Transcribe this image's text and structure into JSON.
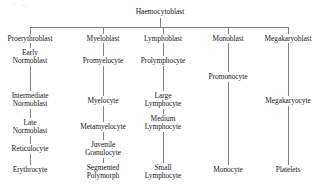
{
  "figure": {
    "root": {
      "label": "Haemocytoblast",
      "x": 160,
      "y": 8
    },
    "bus": {
      "y": 27,
      "x_start": 30,
      "x_end": 288,
      "stem_from_y": 18
    },
    "background_color": "#ffffff",
    "line_color": "#6d6d72",
    "text_color": "#17171a"
  },
  "columns": [
    {
      "name": "erythroid",
      "x": 30,
      "nodes": [
        {
          "label": "Proerythroblast",
          "y": 35
        },
        {
          "label": "Early\nNormoblast",
          "y": 49
        },
        {
          "label": "Intermediate\nNormoblast",
          "y": 92
        },
        {
          "label": "Late\nNormoblast",
          "y": 119
        },
        {
          "label": "Reticulocyte",
          "y": 145
        },
        {
          "label": "Erythrocyte",
          "y": 166
        }
      ]
    },
    {
      "name": "granulocytic",
      "x": 103,
      "nodes": [
        {
          "label": "Myeloblast",
          "y": 35
        },
        {
          "label": "Promyelocyte",
          "y": 57
        },
        {
          "label": "Myelocyte",
          "y": 97
        },
        {
          "label": "Metamyelocyte",
          "y": 123
        },
        {
          "label": "Juvenile\nGranulocyte",
          "y": 141
        },
        {
          "label": "Segmented\nPolymorph",
          "y": 164
        }
      ]
    },
    {
      "name": "lymphoid",
      "x": 163,
      "nodes": [
        {
          "label": "Lymphoblast",
          "y": 35
        },
        {
          "label": "Prolymphocyte",
          "y": 57
        },
        {
          "label": "Large\nLymphocyte",
          "y": 92
        },
        {
          "label": "Medium\nLymphocyte",
          "y": 115
        },
        {
          "label": "Small\nLymphocyte",
          "y": 164
        }
      ]
    },
    {
      "name": "monocytic",
      "x": 228,
      "nodes": [
        {
          "label": "Monoblast",
          "y": 35
        },
        {
          "label": "Promonocyte",
          "y": 73
        },
        {
          "label": "Monocyte",
          "y": 166
        }
      ]
    },
    {
      "name": "megakaryocytic",
      "x": 288,
      "nodes": [
        {
          "label": "Megakaryoblast",
          "y": 35
        },
        {
          "label": "Megakaryocyte",
          "y": 97
        },
        {
          "label": "Platelets",
          "y": 166
        }
      ]
    }
  ],
  "connectors": [
    {
      "from": "root",
      "to": "bus",
      "x": 160,
      "y1": 18,
      "y2": 27
    },
    {
      "from": "bus",
      "to": "Proerythroblast",
      "x": 30,
      "y1": 27,
      "y2": 34
    },
    {
      "from": "bus",
      "to": "Myeloblast",
      "x": 103,
      "y1": 27,
      "y2": 34
    },
    {
      "from": "bus",
      "to": "Lymphoblast",
      "x": 163,
      "y1": 27,
      "y2": 34
    },
    {
      "from": "bus",
      "to": "Monoblast",
      "x": 228,
      "y1": 27,
      "y2": 34
    },
    {
      "from": "bus",
      "to": "Megakaryoblast",
      "x": 288,
      "y1": 27,
      "y2": 34
    },
    {
      "from": "Proerythroblast",
      "to": "Early Normoblast",
      "x": 30,
      "y1": 43,
      "y2": 48
    },
    {
      "from": "Early Normoblast",
      "to": "Intermediate Normoblast",
      "x": 30,
      "y1": 66,
      "y2": 91
    },
    {
      "from": "Intermediate Normoblast",
      "to": "Late Normoblast",
      "x": 30,
      "y1": 109,
      "y2": 118
    },
    {
      "from": "Late Normoblast",
      "to": "Reticulocyte",
      "x": 30,
      "y1": 136,
      "y2": 144
    },
    {
      "from": "Reticulocyte",
      "to": "Erythrocyte",
      "x": 30,
      "y1": 154,
      "y2": 165
    },
    {
      "from": "Myeloblast",
      "to": "Promyelocyte",
      "x": 103,
      "y1": 43,
      "y2": 56
    },
    {
      "from": "Promyelocyte",
      "to": "Myelocyte",
      "x": 103,
      "y1": 66,
      "y2": 96
    },
    {
      "from": "Myelocyte",
      "to": "Metamyelocyte",
      "x": 103,
      "y1": 106,
      "y2": 122
    },
    {
      "from": "Metamyelocyte",
      "to": "Juvenile Granulocyte",
      "x": 103,
      "y1": 132,
      "y2": 140
    },
    {
      "from": "Juvenile Granulocyte",
      "to": "Segmented Polymorph",
      "x": 103,
      "y1": 158,
      "y2": 163
    },
    {
      "from": "Lymphoblast",
      "to": "Prolymphocyte",
      "x": 163,
      "y1": 43,
      "y2": 56
    },
    {
      "from": "Prolymphocyte",
      "to": "Large Lymphocyte",
      "x": 163,
      "y1": 66,
      "y2": 91
    },
    {
      "from": "Large Lymphocyte",
      "to": "Medium Lymphocyte",
      "x": 163,
      "y1": 109,
      "y2": 114
    },
    {
      "from": "Medium Lymphocyte",
      "to": "Small Lymphocyte",
      "x": 163,
      "y1": 132,
      "y2": 163
    },
    {
      "from": "Monoblast",
      "to": "Promonocyte",
      "x": 228,
      "y1": 43,
      "y2": 72
    },
    {
      "from": "Promonocyte",
      "to": "Monocyte",
      "x": 228,
      "y1": 82,
      "y2": 165
    },
    {
      "from": "Megakaryoblast",
      "to": "Megakaryocyte",
      "x": 288,
      "y1": 43,
      "y2": 96
    },
    {
      "from": "Megakaryocyte",
      "to": "Platelets",
      "x": 288,
      "y1": 106,
      "y2": 165
    }
  ]
}
